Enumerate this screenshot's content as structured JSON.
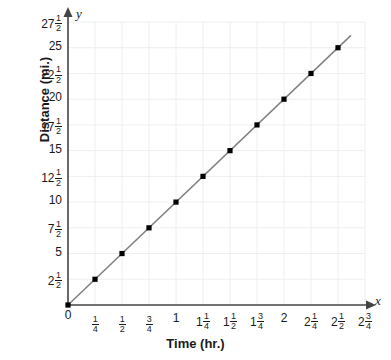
{
  "chart_data": {
    "type": "line",
    "title": "",
    "subtitle": "",
    "xlabel": "Time (hr.)",
    "ylabel": "Distance (mi.)",
    "x_axis_letter": "y",
    "y_axis_letter": "x",
    "xlim": [
      0,
      2.75
    ],
    "ylim": [
      0,
      27.5
    ],
    "grid": true,
    "legend": "none",
    "origin_label": "0",
    "series": [
      {
        "name": "Distance vs Time",
        "color": "#808080",
        "marker": "square",
        "x": [
          0,
          0.25,
          0.5,
          0.75,
          1,
          1.25,
          1.5,
          1.75,
          2,
          2.25,
          2.5
        ],
        "y": [
          0,
          2.5,
          5,
          7.5,
          10,
          12.5,
          15,
          17.5,
          20,
          22.5,
          25
        ],
        "slope": 10,
        "intercept": 0
      }
    ],
    "x_ticks": [
      {
        "value": 0,
        "whole": "0",
        "num": "",
        "den": ""
      },
      {
        "value": 0.25,
        "whole": "",
        "num": "1",
        "den": "4"
      },
      {
        "value": 0.5,
        "whole": "",
        "num": "1",
        "den": "2"
      },
      {
        "value": 0.75,
        "whole": "",
        "num": "3",
        "den": "4"
      },
      {
        "value": 1,
        "whole": "1",
        "num": "",
        "den": ""
      },
      {
        "value": 1.25,
        "whole": "1",
        "num": "1",
        "den": "4"
      },
      {
        "value": 1.5,
        "whole": "1",
        "num": "1",
        "den": "2"
      },
      {
        "value": 1.75,
        "whole": "1",
        "num": "3",
        "den": "4"
      },
      {
        "value": 2,
        "whole": "2",
        "num": "",
        "den": ""
      },
      {
        "value": 2.25,
        "whole": "2",
        "num": "1",
        "den": "4"
      },
      {
        "value": 2.5,
        "whole": "2",
        "num": "1",
        "den": "2"
      },
      {
        "value": 2.75,
        "whole": "2",
        "num": "3",
        "den": "4"
      }
    ],
    "y_ticks": [
      {
        "value": 27.5,
        "whole": "27",
        "num": "1",
        "den": "2"
      },
      {
        "value": 25,
        "whole": "25",
        "num": "",
        "den": ""
      },
      {
        "value": 22.5,
        "whole": "22",
        "num": "1",
        "den": "2"
      },
      {
        "value": 20,
        "whole": "20",
        "num": "",
        "den": ""
      },
      {
        "value": 17.5,
        "whole": "17",
        "num": "1",
        "den": "2"
      },
      {
        "value": 15,
        "whole": "15",
        "num": "",
        "den": ""
      },
      {
        "value": 12.5,
        "whole": "12",
        "num": "1",
        "den": "2"
      },
      {
        "value": 10,
        "whole": "10",
        "num": "",
        "den": ""
      },
      {
        "value": 7.5,
        "whole": "7",
        "num": "1",
        "den": "2"
      },
      {
        "value": 5,
        "whole": "5",
        "num": "",
        "den": ""
      },
      {
        "value": 2.5,
        "whole": "2",
        "num": "1",
        "den": "2"
      }
    ],
    "colors": {
      "line": "#808080",
      "marker": "#808080",
      "grid": "#eceef2",
      "axis": "#444444",
      "text": "#1a1a1a",
      "background": "#ffffff"
    }
  }
}
